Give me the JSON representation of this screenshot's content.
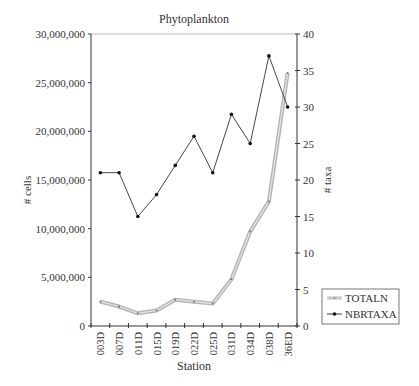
{
  "chart_data": {
    "type": "line",
    "title": "Phytoplankton",
    "xlabel": "Station",
    "ylabel": "# cells",
    "ylabel_right": "# taxa",
    "categories": [
      "003D",
      "007D",
      "011D",
      "015D",
      "019D",
      "022D",
      "025D",
      "031D",
      "034D",
      "038D",
      "36ED"
    ],
    "ylim": [
      0,
      30000000
    ],
    "ylim_right": [
      0,
      40
    ],
    "yticks": [
      0,
      5000000,
      10000000,
      15000000,
      20000000,
      25000000,
      30000000
    ],
    "ytick_labels": [
      "0",
      "5,000,000",
      "10,000,000",
      "15,000,000",
      "20,000,000",
      "25,000,000",
      "30,000,000"
    ],
    "yticks_right": [
      0,
      5,
      10,
      15,
      20,
      25,
      30,
      35,
      40
    ],
    "ytick_labels_right": [
      "0",
      "5",
      "10",
      "15",
      "20",
      "25",
      "30",
      "35",
      "40"
    ],
    "grid": false,
    "legend_position": "right-bottom, outside plot",
    "series": [
      {
        "name": "TOTALN",
        "axis": "left",
        "style": "thick gray double line with small markers",
        "color": "#b0b0b0",
        "values": [
          2500000,
          2000000,
          1300000,
          1600000,
          2700000,
          2500000,
          2300000,
          4800000,
          9700000,
          12800000,
          26000000
        ]
      },
      {
        "name": "NBRTAXA",
        "axis": "right",
        "style": "thin black line with dot markers",
        "color": "#222222",
        "values": [
          21,
          21,
          15,
          18,
          22,
          26,
          21,
          29,
          25,
          37,
          30
        ]
      }
    ]
  },
  "legend": {
    "items": [
      {
        "label": "TOTALN"
      },
      {
        "label": "NBRTAXA"
      }
    ]
  }
}
